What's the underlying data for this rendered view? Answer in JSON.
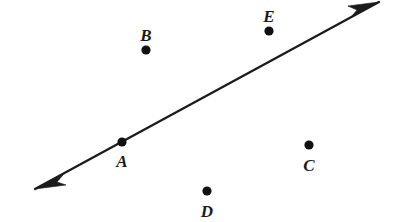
{
  "figure": {
    "background_color": "#ffffff",
    "ink_color": "#1b1b1b",
    "width": 400,
    "height": 222
  },
  "line": {
    "name": "line-through-A",
    "type": "double-headed-line",
    "start_x": 35,
    "start_y": 189,
    "end_x": 379,
    "end_y": 2,
    "stroke_width": 2.3,
    "arrow_start": true,
    "arrow_end": true
  },
  "points": [
    {
      "label": "A",
      "dot_x": 122,
      "dot_y": 142,
      "radius": 4.6,
      "label_x": 122,
      "label_y": 167,
      "on_line": true
    },
    {
      "label": "B",
      "dot_x": 146,
      "dot_y": 50,
      "radius": 4.6,
      "label_x": 146,
      "label_y": 41,
      "on_line": false
    },
    {
      "label": "C",
      "dot_x": 309,
      "dot_y": 145,
      "radius": 4.6,
      "label_x": 309,
      "label_y": 171,
      "on_line": false
    },
    {
      "label": "D",
      "dot_x": 207,
      "dot_y": 191,
      "radius": 4.6,
      "label_x": 207,
      "label_y": 217,
      "on_line": false
    },
    {
      "label": "E",
      "dot_x": 269,
      "dot_y": 31,
      "radius": 4.6,
      "label_x": 269,
      "label_y": 22,
      "on_line": false
    }
  ],
  "arrowheads": [
    {
      "name": "arrowhead-lower-left",
      "points": "35,189 63,175 57,182 66,185"
    },
    {
      "name": "arrowhead-upper-right",
      "points": "379,2 351,17 357,10 348,6"
    }
  ]
}
